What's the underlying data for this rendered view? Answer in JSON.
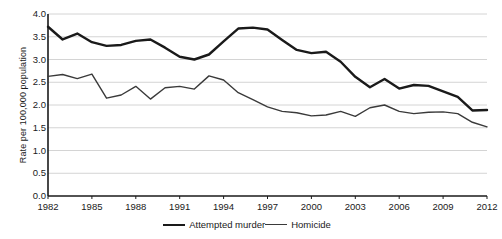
{
  "chart_data": {
    "type": "line",
    "title": "",
    "xlabel": "",
    "ylabel": "Rate per 100,000 population",
    "xlim": [
      1982,
      2012
    ],
    "ylim": [
      0.0,
      4.0
    ],
    "ytick_labels": [
      "0.0",
      "0.5",
      "1.0",
      "1.5",
      "2.0",
      "2.5",
      "3.0",
      "3.5",
      "4.0"
    ],
    "ytick_values": [
      0.0,
      0.5,
      1.0,
      1.5,
      2.0,
      2.5,
      3.0,
      3.5,
      4.0
    ],
    "xtick_labels": [
      "1982",
      "1985",
      "1988",
      "1991",
      "1994",
      "1997",
      "2000",
      "2003",
      "2006",
      "2009",
      "2012"
    ],
    "xtick_values": [
      1982,
      1985,
      1988,
      1991,
      1994,
      1997,
      2000,
      2003,
      2006,
      2009,
      2012
    ],
    "x": [
      1982,
      1983,
      1984,
      1985,
      1986,
      1987,
      1988,
      1989,
      1990,
      1991,
      1992,
      1993,
      1994,
      1995,
      1996,
      1997,
      1998,
      1999,
      2000,
      2001,
      2002,
      2003,
      2004,
      2005,
      2006,
      2007,
      2008,
      2009,
      2010,
      2011,
      2012
    ],
    "grid": true,
    "legend_position": "bottom",
    "series": [
      {
        "name": "Attempted murder",
        "color": "#1a1a1a",
        "width": 2.4,
        "values": [
          3.72,
          3.44,
          3.57,
          3.38,
          3.3,
          3.32,
          3.41,
          3.44,
          3.26,
          3.06,
          3.0,
          3.11,
          3.4,
          3.68,
          3.7,
          3.66,
          3.43,
          3.21,
          3.14,
          3.17,
          2.95,
          2.62,
          2.39,
          2.57,
          2.36,
          2.44,
          2.42,
          2.3,
          2.18,
          1.88,
          1.89
        ]
      },
      {
        "name": "Homicide",
        "color": "#3a3a3a",
        "width": 1.4,
        "values": [
          2.63,
          2.67,
          2.58,
          2.68,
          2.15,
          2.22,
          2.41,
          2.13,
          2.38,
          2.41,
          2.35,
          2.64,
          2.55,
          2.27,
          2.12,
          1.96,
          1.86,
          1.83,
          1.76,
          1.78,
          1.86,
          1.75,
          1.94,
          2.0,
          1.86,
          1.81,
          1.84,
          1.85,
          1.81,
          1.62,
          1.52
        ]
      }
    ],
    "legend": [
      {
        "label": "Attempted murder",
        "style": "thick"
      },
      {
        "label": "Homicide",
        "style": "thin"
      }
    ]
  }
}
